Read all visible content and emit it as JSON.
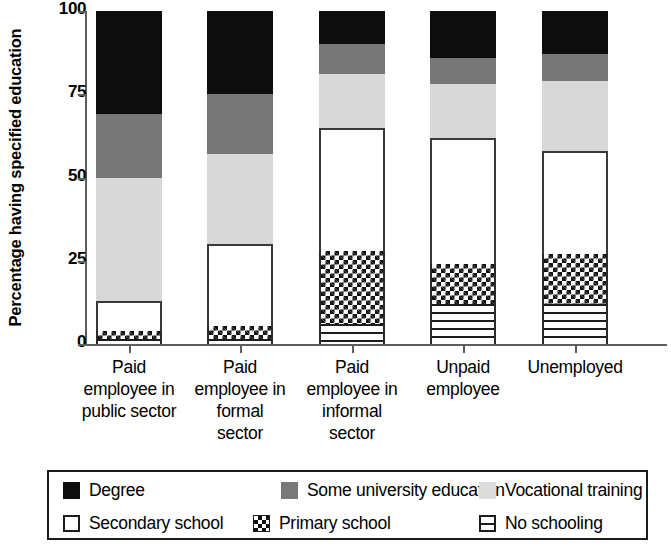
{
  "chart_data": {
    "type": "bar",
    "stacked": true,
    "title": "",
    "xlabel": "",
    "ylabel": "Percentage having specified education",
    "ylim": [
      0,
      100
    ],
    "yticks": [
      "0",
      "25",
      "50",
      "75",
      "100"
    ],
    "grid": false,
    "legend_position": "bottom",
    "categories": [
      "Paid employee in public sector",
      "Paid employee in formal sector",
      "Paid employee in informal sector",
      "Unpaid employee",
      "Unemployed"
    ],
    "category_lines": [
      [
        "Paid",
        "employee in",
        "public sector"
      ],
      [
        "Paid",
        "employee in",
        "formal",
        "sector"
      ],
      [
        "Paid",
        "employee in",
        "informal",
        "sector"
      ],
      [
        "Unpaid",
        "employee"
      ],
      [
        "Unemployed"
      ]
    ],
    "series": [
      {
        "name": "No schooling",
        "key": "noschool",
        "fill": "horizontal-stripes",
        "color": "#ffffff",
        "values": [
          1.5,
          1.5,
          6,
          12,
          12
        ]
      },
      {
        "name": "Primary school",
        "key": "primary",
        "fill": "checkered",
        "color": "#ffffff",
        "values": [
          2.5,
          4,
          22,
          12,
          15
        ]
      },
      {
        "name": "Secondary school",
        "key": "secondary",
        "fill": "solid",
        "color": "#ffffff",
        "values": [
          9,
          24.5,
          37,
          38,
          31
        ]
      },
      {
        "name": "Vocational training",
        "key": "vocational",
        "fill": "solid",
        "color": "#d8d8d8",
        "values": [
          37,
          27,
          16,
          16,
          21
        ]
      },
      {
        "name": "Some university education",
        "key": "someuni",
        "fill": "solid",
        "color": "#777777",
        "values": [
          19,
          18,
          9,
          8,
          8
        ]
      },
      {
        "name": "Degree",
        "key": "degree",
        "fill": "solid",
        "color": "#0d0d0d",
        "values": [
          31,
          25,
          10,
          14,
          13
        ]
      }
    ],
    "cumulative_tops": {
      "Paid employee in public sector": {
        "noschool": 1.5,
        "primary": 4,
        "secondary": 13,
        "vocational": 50,
        "someuni": 69,
        "degree": 100
      },
      "Paid employee in formal sector": {
        "noschool": 1.5,
        "primary": 5.5,
        "secondary": 30,
        "vocational": 57,
        "someuni": 75,
        "degree": 100
      },
      "Paid employee in informal sector": {
        "noschool": 6,
        "primary": 28,
        "secondary": 65,
        "vocational": 81,
        "someuni": 90,
        "degree": 100
      },
      "Unpaid employee": {
        "noschool": 12,
        "primary": 24,
        "secondary": 62,
        "vocational": 78,
        "someuni": 86,
        "degree": 100
      },
      "Unemployed": {
        "noschool": 12,
        "primary": 27,
        "secondary": 58,
        "vocational": 79,
        "someuni": 87,
        "degree": 100
      }
    }
  },
  "legend": {
    "row1": [
      {
        "label": "Degree",
        "swatch": "sw-degree"
      },
      {
        "label": "Some university education",
        "swatch": "sw-someuni"
      },
      {
        "label": "Vocational training",
        "swatch": "sw-vocational"
      }
    ],
    "row2": [
      {
        "label": "Secondary school",
        "swatch": "sw-secondary"
      },
      {
        "label": "Primary school",
        "swatch": "sw-primary"
      },
      {
        "label": "No schooling",
        "swatch": "sw-noschool"
      }
    ]
  }
}
